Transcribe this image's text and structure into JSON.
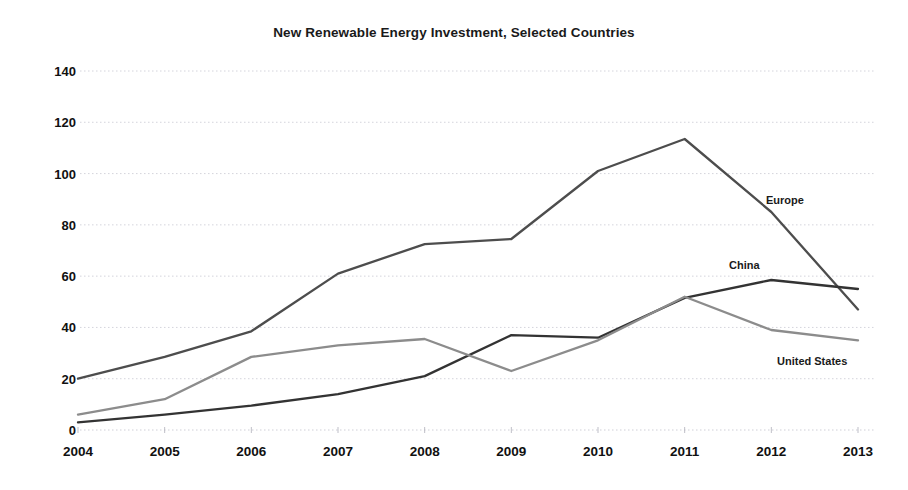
{
  "chart_data": {
    "type": "line",
    "title": "New Renewable Energy Investment, Selected Countries",
    "xlabel": "",
    "ylabel": "",
    "categories": [
      "2004",
      "2005",
      "2006",
      "2007",
      "2008",
      "2009",
      "2010",
      "2011",
      "2012",
      "2013"
    ],
    "x": [
      2004,
      2005,
      2006,
      2007,
      2008,
      2009,
      2010,
      2011,
      2012,
      2013
    ],
    "ylim": [
      0,
      140
    ],
    "yticks": [
      0,
      20,
      40,
      60,
      80,
      100,
      120,
      140
    ],
    "grid": true,
    "legend_position": "inline-right",
    "series": [
      {
        "name": "Europe",
        "color": "#4d4d4d",
        "values": [
          20,
          28.5,
          38.5,
          61,
          72.5,
          74.5,
          101,
          113.5,
          85,
          47
        ]
      },
      {
        "name": "China",
        "color": "#333333",
        "values": [
          3,
          6,
          9.5,
          14,
          21,
          37,
          36,
          51.5,
          58.5,
          55
        ]
      },
      {
        "name": "United States",
        "color": "#8c8c8c",
        "values": [
          6,
          12,
          28.5,
          33,
          35.5,
          23,
          35,
          52,
          39,
          35
        ]
      }
    ],
    "annotations": [
      {
        "text": "Europe",
        "series": "Europe"
      },
      {
        "text": "China",
        "series": "China"
      },
      {
        "text": "United States",
        "series": "United States"
      }
    ]
  },
  "style": {
    "background": "#ffffff",
    "gridline_color": "#cfcfd8",
    "axis_text_color": "#111111",
    "title_color": "#1a1a1a"
  }
}
